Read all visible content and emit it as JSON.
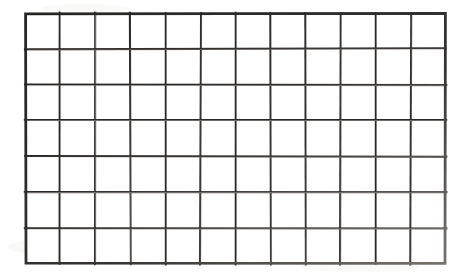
{
  "document": {
    "title": "Blank Grid Worksheet",
    "kind": "blank-grid",
    "background_color": "#ffffff",
    "canvas": {
      "width": 469,
      "height": 278
    }
  },
  "grid": {
    "columns": 12,
    "rows": 7,
    "cells_total": 84,
    "origin_x": 25,
    "origin_y": 13,
    "width": 421,
    "height": 251,
    "cell_width": 35.08,
    "cell_height": 35.86,
    "line_color": "#2e2c2b",
    "line_color_light": "#5d5a58",
    "line_color_faded": "#8d8a88",
    "line_width": 2.1,
    "border_width": 2.6,
    "cell_fill": "#ffffff",
    "labels": {
      "column_headers": [],
      "row_headers": [],
      "cell_values": []
    }
  },
  "appearance": {
    "style": "scanned-hand-drawn",
    "paper_tone": "#ffffff",
    "noise_tone": "#f3f2f1",
    "fade_direction": "bottom-right"
  }
}
